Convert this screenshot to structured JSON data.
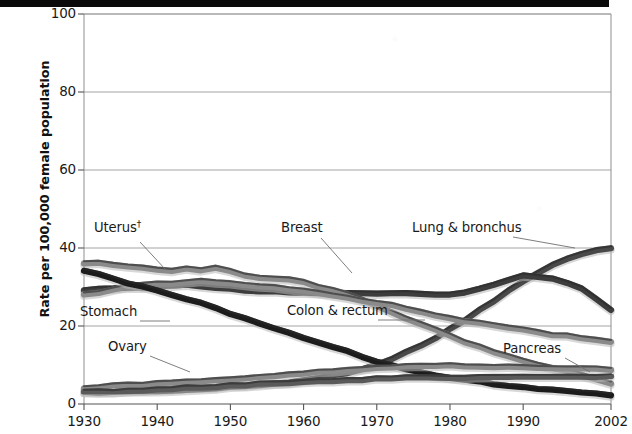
{
  "chart_data": {
    "type": "line",
    "title": "",
    "xlabel": "",
    "ylabel": "Rate per 100,000 female population",
    "xlim": [
      1930,
      2002
    ],
    "ylim": [
      0,
      100
    ],
    "grid": true,
    "legend_position": "inline-annotations",
    "ytick_labels": [
      "0",
      "20",
      "40",
      "60",
      "80",
      "100"
    ],
    "ytick_values": [
      0,
      20,
      40,
      60,
      80,
      100
    ],
    "xtick_labels": [
      "1930",
      "1940",
      "1950",
      "1960",
      "1970",
      "1980",
      "1990",
      "2002"
    ],
    "xtick_values": [
      1930,
      1940,
      1950,
      1960,
      1970,
      1980,
      1990,
      2002
    ],
    "x": [
      1930,
      1932,
      1934,
      1936,
      1938,
      1940,
      1942,
      1944,
      1946,
      1948,
      1950,
      1952,
      1954,
      1956,
      1958,
      1960,
      1962,
      1964,
      1966,
      1968,
      1970,
      1972,
      1974,
      1976,
      1978,
      1980,
      1982,
      1984,
      1986,
      1988,
      1990,
      1992,
      1994,
      1996,
      1998,
      2000,
      2002
    ],
    "series": [
      {
        "name": "Lung & bronchus",
        "label": "Lung & bronchus",
        "color": "#4a4a4a",
        "values": [
          3.0,
          3.0,
          3.1,
          3.2,
          3.3,
          3.4,
          3.5,
          3.6,
          3.8,
          4.0,
          4.3,
          4.6,
          4.9,
          5.2,
          5.6,
          6.0,
          6.6,
          7.3,
          8.1,
          9.0,
          10.2,
          11.6,
          13.2,
          15.0,
          17.0,
          19.2,
          21.5,
          24.0,
          26.5,
          29.0,
          31.4,
          33.6,
          35.6,
          37.2,
          38.5,
          39.3,
          40.0
        ]
      },
      {
        "name": "Breast",
        "label": "Breast",
        "color": "#3c3c3c",
        "values": [
          29.0,
          29.4,
          29.6,
          29.8,
          30.0,
          30.2,
          30.4,
          30.6,
          30.2,
          29.8,
          29.5,
          29.2,
          29.0,
          28.8,
          28.7,
          28.6,
          28.6,
          28.5,
          28.6,
          28.4,
          28.3,
          28.4,
          28.3,
          28.1,
          28.0,
          28.2,
          28.6,
          29.4,
          30.6,
          31.9,
          32.8,
          32.6,
          32.0,
          31.0,
          29.5,
          27.0,
          24.2
        ]
      },
      {
        "name": "Uterus",
        "label": "Uterus†",
        "color": "#8a8a8a",
        "values": [
          36.0,
          36.2,
          35.6,
          35.4,
          35.0,
          34.6,
          34.2,
          34.6,
          34.4,
          34.8,
          34.0,
          33.0,
          32.4,
          32.0,
          31.8,
          31.2,
          30.0,
          29.2,
          28.0,
          26.6,
          25.0,
          23.6,
          22.0,
          20.4,
          19.0,
          17.4,
          16.0,
          14.6,
          13.4,
          12.2,
          11.2,
          10.2,
          9.2,
          8.4,
          7.4,
          6.4,
          5.4
        ]
      },
      {
        "name": "Colon & rectum",
        "label": "Colon & rectum",
        "color": "#8a8a8a",
        "values": [
          28.0,
          28.6,
          29.4,
          30.0,
          30.4,
          30.8,
          31.0,
          31.2,
          31.4,
          31.2,
          31.0,
          30.6,
          30.2,
          29.8,
          29.4,
          29.0,
          28.4,
          27.8,
          27.2,
          26.6,
          26.0,
          25.4,
          24.6,
          23.6,
          22.8,
          22.0,
          21.4,
          20.8,
          20.2,
          19.6,
          19.0,
          18.4,
          17.8,
          17.4,
          17.0,
          16.5,
          16.0
        ]
      },
      {
        "name": "Stomach",
        "label": "Stomach",
        "color": "#1c1c1c",
        "values": [
          34.0,
          33.2,
          32.0,
          31.0,
          30.0,
          29.0,
          28.0,
          27.0,
          26.0,
          24.8,
          23.2,
          22.0,
          20.8,
          19.4,
          18.2,
          17.0,
          15.8,
          14.6,
          13.4,
          12.2,
          11.0,
          10.0,
          9.0,
          8.2,
          7.4,
          6.8,
          6.2,
          5.7,
          5.2,
          4.8,
          4.4,
          4.0,
          3.7,
          3.4,
          3.0,
          2.6,
          2.3
        ]
      },
      {
        "name": "Ovary",
        "label": "Ovary",
        "color": "#8a8a8a",
        "values": [
          4.2,
          4.4,
          4.6,
          4.8,
          5.0,
          5.2,
          5.4,
          5.6,
          5.9,
          6.1,
          6.4,
          6.7,
          7.0,
          7.3,
          7.6,
          7.9,
          8.2,
          8.5,
          8.8,
          9.1,
          9.3,
          9.5,
          9.6,
          9.7,
          9.8,
          9.8,
          9.8,
          9.7,
          9.6,
          9.5,
          9.4,
          9.3,
          9.2,
          9.1,
          9.0,
          9.0,
          8.9
        ]
      },
      {
        "name": "Pancreas",
        "label": "Pancreas",
        "color": "#5a5a5a",
        "values": [
          3.0,
          3.1,
          3.2,
          3.4,
          3.5,
          3.7,
          3.9,
          4.1,
          4.3,
          4.5,
          4.7,
          4.9,
          5.1,
          5.3,
          5.5,
          5.7,
          5.9,
          6.0,
          6.2,
          6.3,
          6.5,
          6.6,
          6.7,
          6.7,
          6.8,
          6.8,
          6.8,
          6.8,
          6.9,
          6.9,
          6.9,
          6.9,
          7.0,
          7.0,
          7.0,
          7.0,
          7.1
        ]
      }
    ],
    "annotations": [
      {
        "name": "uterus",
        "text": "Uterus†",
        "x": 94,
        "y": 228,
        "leader": [
          140,
          242,
          166,
          270
        ]
      },
      {
        "name": "stomach",
        "text": "Stomach",
        "x": 80,
        "y": 313,
        "leader": [
          140,
          321,
          170,
          321
        ]
      },
      {
        "name": "ovary",
        "text": "Ovary",
        "x": 108,
        "y": 348,
        "leader": [
          150,
          356,
          190,
          372
        ]
      },
      {
        "name": "breast",
        "text": "Breast",
        "x": 281,
        "y": 229,
        "leader": [
          321,
          238,
          352,
          273
        ]
      },
      {
        "name": "colon-rectum",
        "text": "Colon & rectum",
        "x": 287,
        "y": 312,
        "leader": [
          378,
          320,
          425,
          320
        ]
      },
      {
        "name": "lung-bronchus",
        "text": "Lung & bronchus",
        "x": 412,
        "y": 229,
        "leader": [
          513,
          237,
          575,
          248
        ]
      },
      {
        "name": "pancreas",
        "text": "Pancreas",
        "x": 503,
        "y": 350,
        "leader": [
          565,
          358,
          590,
          372
        ]
      }
    ]
  }
}
